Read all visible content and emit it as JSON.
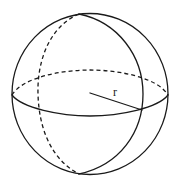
{
  "diagram": {
    "type": "sphere",
    "labels": {
      "radius": "r"
    },
    "colors": {
      "stroke": "#1a1a1a",
      "background": "#ffffff"
    },
    "elements": [
      {
        "name": "outer-circle",
        "style": "solid"
      },
      {
        "name": "equator-front",
        "style": "solid"
      },
      {
        "name": "equator-back",
        "style": "dashed"
      },
      {
        "name": "meridian-front",
        "style": "solid"
      },
      {
        "name": "meridian-back",
        "style": "dashed"
      },
      {
        "name": "radius-line",
        "style": "solid",
        "label": "r"
      }
    ]
  }
}
